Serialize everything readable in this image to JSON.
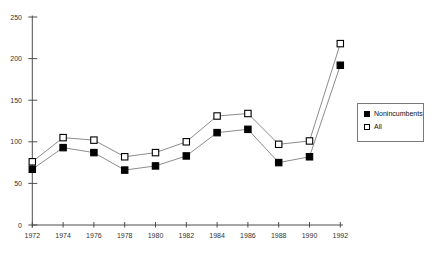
{
  "chart_data": {
    "type": "line",
    "title": "",
    "xlabel": "",
    "ylabel": "",
    "x": [
      1972,
      1974,
      1976,
      1978,
      1980,
      1982,
      1984,
      1986,
      1988,
      1990,
      1992
    ],
    "series": [
      {
        "name": "All",
        "marker": "open-square",
        "values": [
          76,
          105,
          102,
          82,
          87,
          100,
          131,
          134,
          97,
          101,
          218
        ]
      },
      {
        "name": "Nonincumbents",
        "marker": "filled-square",
        "values": [
          67,
          93,
          87,
          66,
          71,
          83,
          111,
          115,
          75,
          82,
          192
        ]
      }
    ],
    "ylim": [
      0,
      250
    ],
    "yticks": [
      0,
      50,
      100,
      150,
      200,
      250
    ],
    "grid": false,
    "legend_position": "right-middle",
    "axis_color": "#4d4d4d",
    "line_color": "#8c8c8c",
    "marker_stroke_color": "#000000",
    "tick_label_color": "#333333"
  },
  "legend": {
    "items": [
      {
        "label": "Nonincumbents",
        "marker": "filled-square"
      },
      {
        "label": "All",
        "marker": "open-square"
      }
    ]
  }
}
